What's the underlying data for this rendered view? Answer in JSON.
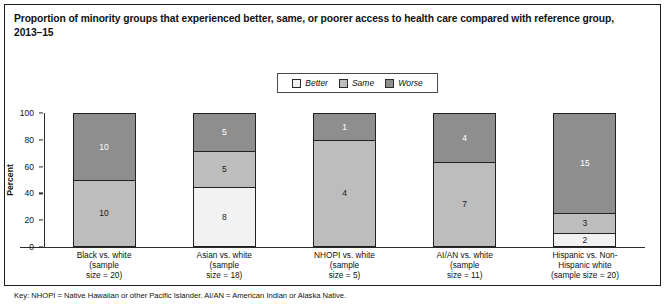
{
  "title": "Proportion of minority groups that experienced better, same, or poorer access to health care compared with reference group, 2013–15",
  "footnote": "Key: NHOPI = Native Hawaiian or other Pacific Islander. AI/AN = American Indian or Alaska Native.",
  "legend": {
    "items": [
      {
        "label": "Better",
        "color": "#f2f2f2"
      },
      {
        "label": "Same",
        "color": "#bdbdbd"
      },
      {
        "label": "Worse",
        "color": "#8e8e8e"
      }
    ]
  },
  "chart_data": {
    "type": "bar",
    "subtype": "stacked-100-percent",
    "title": "Proportion of minority groups that experienced better, same, or poorer access to health care compared with reference group, 2013–15",
    "xlabel": "",
    "ylabel": "Percent",
    "ylim": [
      0,
      100
    ],
    "yticks": [
      0,
      20,
      40,
      60,
      80,
      100
    ],
    "grid": false,
    "legend_position": "top-center",
    "categories": [
      "Black vs. white\n(sample\nsize = 20)",
      "Asian vs. white\n(sample\nsize = 18)",
      "NHOPI vs. white\n(sample\nsize = 5)",
      "AI/AN vs. white\n(sample\nsize = 11)",
      "Hispanic vs. Non-\nHispanic white\n(sample size = 20)"
    ],
    "sample_sizes": [
      20,
      18,
      5,
      11,
      20
    ],
    "series": [
      {
        "name": "Better",
        "values": [
          0,
          8,
          0,
          0,
          2
        ]
      },
      {
        "name": "Same",
        "values": [
          10,
          5,
          4,
          7,
          3
        ]
      },
      {
        "name": "Worse",
        "values": [
          10,
          5,
          1,
          4,
          15
        ]
      }
    ],
    "percent_series": [
      {
        "name": "Better",
        "values": [
          0,
          44.4,
          0,
          0,
          10
        ]
      },
      {
        "name": "Same",
        "values": [
          50,
          27.8,
          80,
          63.6,
          15
        ]
      },
      {
        "name": "Worse",
        "values": [
          50,
          27.8,
          20,
          36.4,
          75
        ]
      }
    ],
    "bars": [
      {
        "category": "Black vs. white\n(sample\nsize = 20)",
        "segments": [
          {
            "name": "Worse",
            "value": 10,
            "percent": 50
          },
          {
            "name": "Same",
            "value": 10,
            "percent": 50
          }
        ]
      },
      {
        "category": "Asian vs. white\n(sample\nsize = 18)",
        "segments": [
          {
            "name": "Worse",
            "value": 5,
            "percent": 27.8
          },
          {
            "name": "Same",
            "value": 5,
            "percent": 27.8
          },
          {
            "name": "Better",
            "value": 8,
            "percent": 44.4
          }
        ]
      },
      {
        "category": "NHOPI vs. white\n(sample\nsize = 5)",
        "segments": [
          {
            "name": "Worse",
            "value": 1,
            "percent": 20
          },
          {
            "name": "Same",
            "value": 4,
            "percent": 80
          }
        ]
      },
      {
        "category": "AI/AN vs. white\n(sample\nsize = 11)",
        "segments": [
          {
            "name": "Worse",
            "value": 4,
            "percent": 36.4
          },
          {
            "name": "Same",
            "value": 7,
            "percent": 63.6
          }
        ]
      },
      {
        "category": "Hispanic vs. Non-\nHispanic white\n(sample size = 20)",
        "segments": [
          {
            "name": "Worse",
            "value": 15,
            "percent": 75
          },
          {
            "name": "Same",
            "value": 3,
            "percent": 15
          },
          {
            "name": "Better",
            "value": 2,
            "percent": 10
          }
        ]
      }
    ]
  }
}
